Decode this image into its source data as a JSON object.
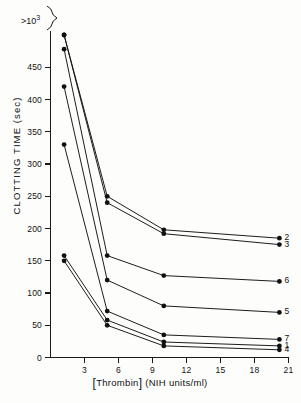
{
  "figure": {
    "ylabel": "CLOTTING TIME (sec)",
    "xlabel_bracket_open": "[",
    "xlabel_analyte": "Thrombin",
    "xlabel_bracket_close": "]",
    "xlabel_units": "(NIH units/ml)",
    "top_tick_label": ">10",
    "top_tick_exponent": "3",
    "axis_break": "break-symbol"
  },
  "chart_data": {
    "type": "line",
    "title": "",
    "xlabel": "[Thrombin] (NIH units/ml)",
    "ylabel": "CLOTTING TIME (sec)",
    "xlim": [
      0,
      21
    ],
    "ylim": [
      0,
      500
    ],
    "xticks": [
      3,
      6,
      9,
      12,
      15,
      18,
      21
    ],
    "yticks": [
      0,
      50,
      100,
      150,
      200,
      250,
      300,
      350,
      400,
      450
    ],
    "ytick_labels": [
      "0",
      "50",
      "100",
      "150",
      "200",
      "250",
      "300",
      "350",
      "400",
      "450"
    ],
    "ytop_label": ">10³",
    "grid": false,
    "legend_position": "right-edge-inline",
    "marker": "filled-circle",
    "series": [
      {
        "name": "2",
        "label": "2",
        "x": [
          1.2,
          5.0,
          10.0,
          20.2
        ],
        "y": [
          500,
          250,
          198,
          185
        ],
        "offscale_first": true
      },
      {
        "name": "3",
        "label": "3",
        "x": [
          1.2,
          5.0,
          10.0,
          20.2
        ],
        "y": [
          500,
          240,
          192,
          175
        ],
        "offscale_first": true
      },
      {
        "name": "6",
        "label": "6",
        "x": [
          1.2,
          5.0,
          10.0,
          20.2
        ],
        "y": [
          478,
          158,
          127,
          118
        ],
        "offscale_first": false
      },
      {
        "name": "5",
        "label": "5",
        "x": [
          1.2,
          5.0,
          10.0,
          20.2
        ],
        "y": [
          420,
          120,
          80,
          70
        ],
        "offscale_first": false
      },
      {
        "name": "7",
        "label": "7",
        "x": [
          1.2,
          5.0,
          10.0,
          20.2
        ],
        "y": [
          330,
          72,
          35,
          28
        ],
        "offscale_first": false
      },
      {
        "name": "1",
        "label": "1",
        "x": [
          1.2,
          5.0,
          10.0,
          20.2
        ],
        "y": [
          158,
          58,
          24,
          18
        ],
        "offscale_first": false
      },
      {
        "name": "4",
        "label": "4",
        "x": [
          1.2,
          5.0,
          10.0,
          20.2
        ],
        "y": [
          150,
          50,
          18,
          12
        ],
        "offscale_first": false
      }
    ]
  }
}
